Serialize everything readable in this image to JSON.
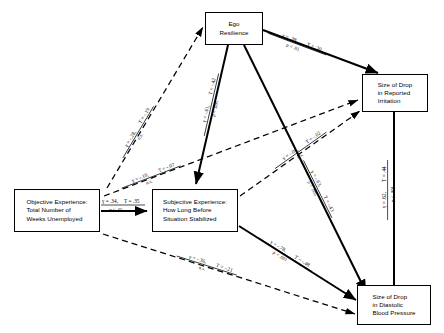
{
  "figure": {
    "type": "path-diagram",
    "nodes": [
      {
        "id": "ego_resilience",
        "label": "Ego\nResilience",
        "x": 205,
        "y": 12,
        "w": 58,
        "h": 33
      },
      {
        "id": "irritation",
        "label": "Size of Drop\nin Reported\nIrritation",
        "x": 362,
        "y": 74,
        "w": 66,
        "h": 38
      },
      {
        "id": "objective_experience",
        "label": "Objective Experience:\nTotal Number of\nWeeks Unemployed",
        "x": 14,
        "y": 189,
        "w": 86,
        "h": 43
      },
      {
        "id": "subjective_experience",
        "label": "Subjective Experience:\nHow Long Before\nSituation Stabilized",
        "x": 152,
        "y": 189,
        "w": 86,
        "h": 43
      },
      {
        "id": "blood_pressure",
        "label": "Size of Drop\nin Diastolic\nBlood Pressure",
        "x": 357,
        "y": 285,
        "w": 74,
        "h": 40
      }
    ],
    "edges": [
      {
        "id": "ego-to-irritation",
        "from": "ego_resilience",
        "to": "irritation",
        "style": "solid",
        "gamma": "γ = .39,",
        "tau": "T = .30",
        "sig": "p < .01"
      },
      {
        "id": "ego-to-subjective",
        "from": "ego_resilience",
        "to": "subjective_experience",
        "style": "solid",
        "gamma": "γ = -.61,",
        "tau": "T = -.42",
        "sig": "p < .005"
      },
      {
        "id": "ego-to-bloodpressure",
        "from": "ego_resilience",
        "to": "blood_pressure",
        "style": "solid",
        "gamma": "γ = -.63,",
        "tau": "T = -.43",
        "sig": "p < .005"
      },
      {
        "id": "objective-to-ego",
        "from": "objective_experience",
        "to": "ego_resilience",
        "style": "dashed",
        "gamma": "γ = -.28,",
        "tau": "T = -.19",
        "sig": "n.s."
      },
      {
        "id": "objective-to-subjective",
        "from": "objective_experience",
        "to": "subjective_experience",
        "style": "solid",
        "gamma": "γ = .34,",
        "tau": "T = .35",
        "sig": "p < .05"
      },
      {
        "id": "objective-to-irritation",
        "from": "objective_experience",
        "to": "irritation",
        "style": "dashed",
        "gamma": "γ = -.10,",
        "tau": "T = -.07",
        "sig": "n.s."
      },
      {
        "id": "objective-to-bloodpressure",
        "from": "objective_experience",
        "to": "blood_pressure",
        "style": "dashed",
        "gamma": "γ = -.36,",
        "tau": "T = -.21",
        "sig": "n.s."
      },
      {
        "id": "subjective-to-bloodpressure",
        "from": "subjective_experience",
        "to": "blood_pressure",
        "style": "solid",
        "gamma": "γ = -.78,",
        "tau": "T = -.48",
        "sig": "p < .001"
      },
      {
        "id": "subjective-to-irritation",
        "from": "subjective_experience",
        "to": "irritation",
        "style": "dashed",
        "gamma": "γ = -.04,",
        "tau": "T = -.02",
        "sig": "n.s."
      },
      {
        "id": "irritation-to-bloodpressure",
        "from": "irritation",
        "to": "blood_pressure",
        "style": "solid",
        "gamma": "γ = .62,",
        "tau": "T = .44",
        "sig": "p < .001"
      }
    ]
  }
}
